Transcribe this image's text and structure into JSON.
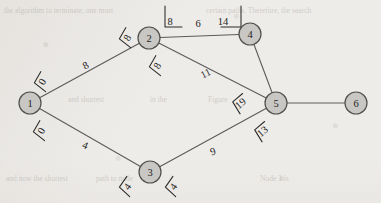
{
  "figure": {
    "type": "weighted-undirected-graph"
  },
  "nodes": [
    {
      "id": "1",
      "label": "1",
      "cx": 30,
      "cy": 103,
      "r": 11
    },
    {
      "id": "2",
      "label": "2",
      "cx": 149,
      "cy": 38,
      "r": 11
    },
    {
      "id": "3",
      "label": "3",
      "cx": 150,
      "cy": 172,
      "r": 11
    },
    {
      "id": "4",
      "label": "4",
      "cx": 250,
      "cy": 34,
      "r": 11
    },
    {
      "id": "5",
      "label": "5",
      "cx": 276,
      "cy": 103,
      "r": 11
    },
    {
      "id": "6",
      "label": "6",
      "cx": 356,
      "cy": 103,
      "r": 11
    }
  ],
  "edges": [
    {
      "from": "1",
      "to": "2",
      "weight": "8",
      "lx": 86,
      "ly": 66,
      "rot": -29
    },
    {
      "from": "2",
      "to": "4",
      "weight": "6",
      "lx": 198,
      "ly": 24,
      "rot": 0
    },
    {
      "from": "2",
      "to": "5",
      "weight": "11",
      "lx": 206,
      "ly": 74,
      "rot": -27
    },
    {
      "from": "4",
      "to": "5",
      "weight": "",
      "lx": 0,
      "ly": 0,
      "rot": 0
    },
    {
      "from": "5",
      "to": "6",
      "weight": "",
      "lx": 0,
      "ly": 0,
      "rot": 0
    },
    {
      "from": "1",
      "to": "3",
      "weight": "4",
      "lx": 85,
      "ly": 146,
      "rot": 22
    },
    {
      "from": "3",
      "to": "5",
      "weight": "9",
      "lx": 213,
      "ly": 152,
      "rot": -19
    }
  ],
  "annotations": [
    {
      "id": "ann-node1-upper",
      "value": "0",
      "x": 43,
      "y": 82,
      "rot": -60,
      "bracket": "angle-left"
    },
    {
      "id": "ann-node1-lower",
      "value": "0",
      "x": 42,
      "y": 131,
      "rot": -60,
      "bracket": "angle-left"
    },
    {
      "id": "ann-node2-left",
      "value": "8",
      "x": 128,
      "y": 38,
      "rot": -60,
      "bracket": "angle-left"
    },
    {
      "id": "ann-node2-lower",
      "value": "8",
      "x": 158,
      "y": 66,
      "rot": -60,
      "bracket": "angle-left"
    },
    {
      "id": "ann-node2-top",
      "value": "8",
      "x": 170,
      "y": 22,
      "rot": 0,
      "bracket": "corner-left"
    },
    {
      "id": "ann-node4-top",
      "value": "14",
      "x": 223,
      "y": 22,
      "rot": 0,
      "bracket": "corner-right"
    },
    {
      "id": "ann-node5-left",
      "value": "19",
      "x": 241,
      "y": 104,
      "rot": -40,
      "bracket": "angle-left"
    },
    {
      "id": "ann-node5-lower",
      "value": "13",
      "x": 263,
      "y": 132,
      "rot": -40,
      "bracket": "angle-left"
    },
    {
      "id": "ann-node3-left",
      "value": "4",
      "x": 128,
      "y": 187,
      "rot": -55,
      "bracket": "angle-left"
    },
    {
      "id": "ann-node3-right",
      "value": "4",
      "x": 174,
      "y": 187,
      "rot": -55,
      "bracket": "angle-left"
    }
  ],
  "background_text": [
    {
      "id": "bg-top-left",
      "text": "the algorithm to terminate, one must",
      "x": 4,
      "y": 6,
      "size": 7.5
    },
    {
      "id": "bg-top-right",
      "text": "certain paths. Therefore, the search",
      "x": 206,
      "y": 6,
      "size": 7.5
    },
    {
      "id": "bg-mid-left",
      "text": "and shortest",
      "x": 68,
      "y": 95,
      "size": 7.5
    },
    {
      "id": "bg-mid-center",
      "text": "in the",
      "x": 150,
      "y": 95,
      "size": 7.5
    },
    {
      "id": "bg-mid-right",
      "text": "Figure",
      "x": 208,
      "y": 95,
      "size": 7.5
    },
    {
      "id": "bg-bottom-left",
      "text": "and now the shortest",
      "x": 6,
      "y": 174,
      "size": 7.5
    },
    {
      "id": "bg-bottom-mid",
      "text": "path to node",
      "x": 96,
      "y": 174,
      "size": 7.5
    },
    {
      "id": "bg-bottom-right",
      "text": "Node 3 is",
      "x": 260,
      "y": 174,
      "size": 7.5
    }
  ],
  "colors": {
    "paper": "#eeece9",
    "node_fill": "#c9c7c4",
    "node_stroke": "#50504e",
    "edge_stroke": "#5c5b59",
    "text": "#232323",
    "bracket": "#2a2a2a"
  }
}
